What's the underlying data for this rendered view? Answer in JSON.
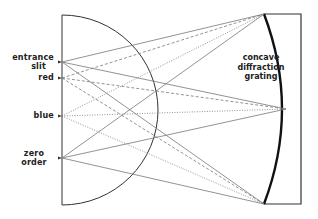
{
  "diagram": {
    "labels": {
      "entrance_slit_line1": "entrance",
      "entrance_slit_line2": "slit",
      "red": "red",
      "blue": "blue",
      "zero_order_line1": "zero",
      "zero_order_line2": "order",
      "grating_line1": "concave",
      "grating_line2": "diffraction",
      "grating_line3": "grating"
    },
    "points": {
      "entrance_slit": [
        62,
        62
      ],
      "red": [
        62,
        78
      ],
      "blue": [
        62,
        116
      ],
      "zero_order": [
        62,
        158
      ],
      "grating_top": [
        264,
        14
      ],
      "grating_center": [
        286,
        109
      ],
      "grating_bottom": [
        264,
        204
      ]
    },
    "line_styles": {
      "entrance_slit": "solid",
      "red": "dashed",
      "blue": "dotted",
      "zero_order": "solid"
    },
    "colors": {
      "ray": "#777777",
      "circle": "#333333",
      "grating": "#111111"
    }
  }
}
